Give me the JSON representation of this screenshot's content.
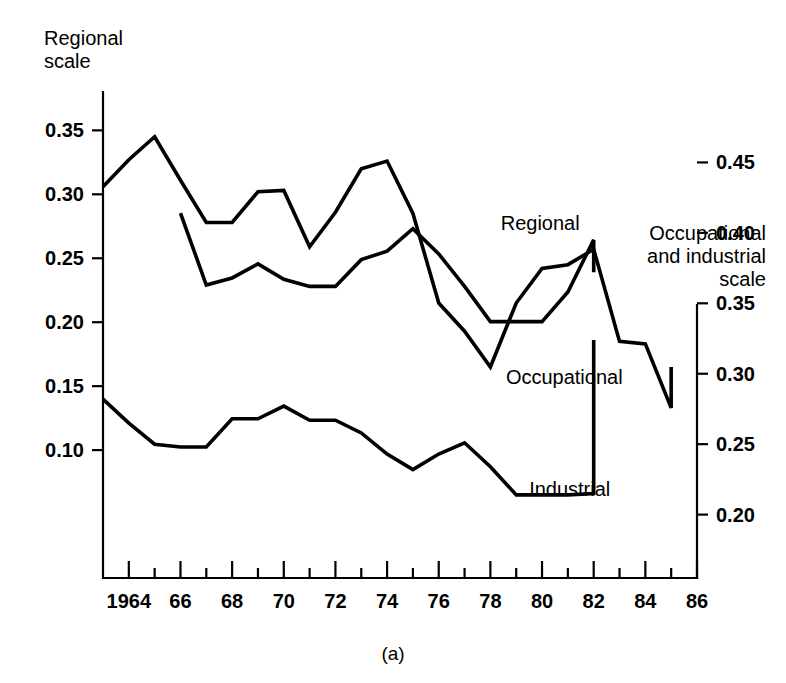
{
  "figure": {
    "caption": "(a)",
    "left_axis_title_line1": "Regional",
    "left_axis_title_line2": "scale",
    "right_axis_title_line1": "Occupational",
    "right_axis_title_line2": "and industrial",
    "right_axis_title_line3": "scale"
  },
  "chart_data": {
    "type": "line",
    "title": "(a)",
    "xlabel": "",
    "ylabel": "Regional scale",
    "y2label": "Occupational and industrial scale",
    "grid": false,
    "legend": "inline-labels",
    "xlim": [
      1963,
      1986
    ],
    "xticks": [
      1964,
      1966,
      1968,
      1970,
      1972,
      1974,
      1976,
      1978,
      1980,
      1982,
      1984,
      1986
    ],
    "xticklabels": [
      "1964",
      "66",
      "68",
      "70",
      "72",
      "74",
      "76",
      "78",
      "80",
      "82",
      "84",
      "86"
    ],
    "xminorticks": [
      1965,
      1967,
      1969,
      1971,
      1973,
      1975,
      1977,
      1979,
      1981,
      1983,
      1985
    ],
    "ylim": [
      0.0,
      0.38
    ],
    "yticks": [
      0.1,
      0.15,
      0.2,
      0.25,
      0.3,
      0.35
    ],
    "yticklabels": [
      "0.10",
      "0.15",
      "0.20",
      "0.25",
      "0.30",
      "0.35"
    ],
    "y2lim": [
      0.155,
      0.5
    ],
    "y2ticks": [
      0.2,
      0.25,
      0.3,
      0.35,
      0.4,
      0.45
    ],
    "y2ticklabels": [
      "0.20",
      "0.25",
      "0.30",
      "0.35",
      "0.40",
      "0.45"
    ],
    "series": [
      {
        "name": "Regional",
        "axis": "left",
        "label_x": 1978.4,
        "label_y": 0.272,
        "x": [
          1963,
          1964,
          1965,
          1966,
          1967,
          1968,
          1969,
          1970,
          1971,
          1972,
          1973,
          1974,
          1975,
          1976,
          1977,
          1978,
          1979,
          1980,
          1981,
          1982,
          1983,
          1984,
          1985
        ],
        "values": [
          0.306,
          0.327,
          0.345,
          0.311,
          0.278,
          0.278,
          0.302,
          0.303,
          0.259,
          0.286,
          0.32,
          0.326,
          0.285,
          0.215,
          0.193,
          0.165,
          0.215,
          0.242,
          0.245,
          0.257,
          0.185,
          0.183,
          0.133
        ]
      },
      {
        "name": "Occupational",
        "axis": "right",
        "label_x": 1978.6,
        "label_y": 0.293,
        "x": [
          1966,
          1967,
          1968,
          1969,
          1970,
          1971,
          1972,
          1973,
          1974,
          1975,
          1976,
          1977,
          1978,
          1979,
          1980,
          1981,
          1982
        ],
        "values": [
          0.414,
          0.363,
          0.368,
          0.378,
          0.367,
          0.362,
          0.362,
          0.381,
          0.387,
          0.403,
          0.385,
          0.362,
          0.337,
          0.337,
          0.337,
          0.358,
          0.395
        ]
      },
      {
        "name": "Industrial",
        "axis": "right",
        "label_x": 1979.5,
        "label_y": 0.213,
        "x": [
          1963,
          1964,
          1965,
          1966,
          1967,
          1968,
          1969,
          1970,
          1971,
          1972,
          1973,
          1974,
          1975,
          1976,
          1977,
          1978,
          1979,
          1980,
          1981,
          1982
        ],
        "values": [
          0.282,
          0.265,
          0.25,
          0.248,
          0.248,
          0.268,
          0.268,
          0.277,
          0.267,
          0.267,
          0.258,
          0.243,
          0.232,
          0.243,
          0.251,
          0.234,
          0.214,
          0.214,
          0.214,
          0.215
        ]
      }
    ]
  },
  "regional_tail": {
    "x": [
      1983,
      1984,
      1985
    ],
    "values": [
      0.133,
      0.157,
      0.165
    ]
  },
  "occupational_tail": {
    "x": [
      1981,
      1982
    ],
    "values": [
      0.403,
      0.372
    ]
  },
  "industrial_tail": {
    "x": [
      1981,
      1982
    ],
    "values": [
      0.343,
      0.324
    ]
  }
}
